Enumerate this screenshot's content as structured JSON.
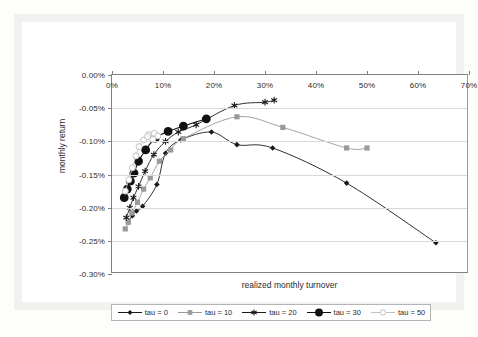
{
  "figure": {
    "caption": ""
  },
  "axes": {
    "ylabel": "monthly return",
    "xlabel": "realized monthly turnover",
    "yticks": [
      "0.00%",
      "-0.05%",
      "-0.10%",
      "-0.15%",
      "-0.20%",
      "-0.25%",
      "-0.30%"
    ],
    "xticks": [
      "0%",
      "10%",
      "20%",
      "30%",
      "40%",
      "50%",
      "60%",
      "70%"
    ]
  },
  "legend": {
    "items": [
      {
        "label": "tau = 0",
        "marker": "diamond",
        "color": "#1a1a1a"
      },
      {
        "label": "tau = 10",
        "marker": "square",
        "color": "#9a9a9a"
      },
      {
        "label": "tau = 20",
        "marker": "star",
        "color": "#1a1a1a"
      },
      {
        "label": "tau = 30",
        "marker": "circle-big",
        "color": "#111111"
      },
      {
        "label": "tau = 50",
        "marker": "open-circle",
        "color": "#c2c2c2"
      }
    ]
  },
  "colors": {
    "tau0": "#1a1a1a",
    "tau10": "#9a9a9a",
    "tau20": "#1a1a1a",
    "tau30": "#111111",
    "tau50": "#c2c2c2",
    "grid": "#d9d9d9",
    "axis": "#808080"
  },
  "chart_data": {
    "type": "line",
    "title": "",
    "xlabel": "realized monthly turnover",
    "ylabel": "monthly return",
    "xlim": [
      0,
      70
    ],
    "ylim": [
      -0.3,
      0.0
    ],
    "xunit": "%",
    "yunit": "%",
    "grid": true,
    "legend_position": "bottom",
    "series": [
      {
        "name": "tau = 0",
        "marker": "diamond",
        "color": "#1a1a1a",
        "points": [
          {
            "x": 3.2,
            "y": -0.222
          },
          {
            "x": 4.0,
            "y": -0.212
          },
          {
            "x": 4.8,
            "y": -0.205
          },
          {
            "x": 6.0,
            "y": -0.198
          },
          {
            "x": 8.8,
            "y": -0.165
          },
          {
            "x": 10.5,
            "y": -0.118
          },
          {
            "x": 13.5,
            "y": -0.098
          },
          {
            "x": 19.5,
            "y": -0.086
          },
          {
            "x": 24.5,
            "y": -0.105
          },
          {
            "x": 31.5,
            "y": -0.11
          },
          {
            "x": 46.0,
            "y": -0.163
          },
          {
            "x": 63.5,
            "y": -0.253
          }
        ]
      },
      {
        "name": "tau = 10",
        "marker": "square",
        "color": "#9a9a9a",
        "points": [
          {
            "x": 2.6,
            "y": -0.232
          },
          {
            "x": 3.2,
            "y": -0.222
          },
          {
            "x": 3.9,
            "y": -0.208
          },
          {
            "x": 5.0,
            "y": -0.192
          },
          {
            "x": 6.2,
            "y": -0.172
          },
          {
            "x": 7.5,
            "y": -0.155
          },
          {
            "x": 9.3,
            "y": -0.13
          },
          {
            "x": 11.5,
            "y": -0.113
          },
          {
            "x": 14.0,
            "y": -0.096
          },
          {
            "x": 24.5,
            "y": -0.063
          },
          {
            "x": 33.5,
            "y": -0.079
          },
          {
            "x": 46.0,
            "y": -0.11
          },
          {
            "x": 50.0,
            "y": -0.11
          }
        ]
      },
      {
        "name": "tau = 20",
        "marker": "star",
        "color": "#1a1a1a",
        "points": [
          {
            "x": 2.8,
            "y": -0.215
          },
          {
            "x": 3.5,
            "y": -0.2
          },
          {
            "x": 4.2,
            "y": -0.185
          },
          {
            "x": 5.2,
            "y": -0.168
          },
          {
            "x": 6.5,
            "y": -0.145
          },
          {
            "x": 8.2,
            "y": -0.12
          },
          {
            "x": 10.5,
            "y": -0.1
          },
          {
            "x": 13.0,
            "y": -0.086
          },
          {
            "x": 16.5,
            "y": -0.075
          },
          {
            "x": 24.0,
            "y": -0.046
          },
          {
            "x": 30.0,
            "y": -0.041
          },
          {
            "x": 31.8,
            "y": -0.038
          }
        ]
      },
      {
        "name": "tau = 30",
        "marker": "circle-big",
        "color": "#111111",
        "points": [
          {
            "x": 2.4,
            "y": -0.185
          },
          {
            "x": 3.0,
            "y": -0.172
          },
          {
            "x": 3.6,
            "y": -0.16
          },
          {
            "x": 4.3,
            "y": -0.148
          },
          {
            "x": 5.2,
            "y": -0.13
          },
          {
            "x": 6.6,
            "y": -0.113
          },
          {
            "x": 8.5,
            "y": -0.095
          },
          {
            "x": 11.0,
            "y": -0.085
          },
          {
            "x": 14.0,
            "y": -0.077
          },
          {
            "x": 18.5,
            "y": -0.066
          }
        ]
      },
      {
        "name": "tau = 50",
        "marker": "open-circle",
        "color": "#c2c2c2",
        "points": [
          {
            "x": 2.6,
            "y": -0.175
          },
          {
            "x": 3.3,
            "y": -0.158
          },
          {
            "x": 4.0,
            "y": -0.14
          },
          {
            "x": 4.7,
            "y": -0.122
          },
          {
            "x": 5.3,
            "y": -0.108
          },
          {
            "x": 6.2,
            "y": -0.098
          },
          {
            "x": 7.2,
            "y": -0.09
          },
          {
            "x": 8.3,
            "y": -0.088
          },
          {
            "x": 9.0,
            "y": -0.092
          },
          {
            "x": 8.0,
            "y": -0.097
          },
          {
            "x": 7.0,
            "y": -0.093
          }
        ]
      }
    ]
  }
}
